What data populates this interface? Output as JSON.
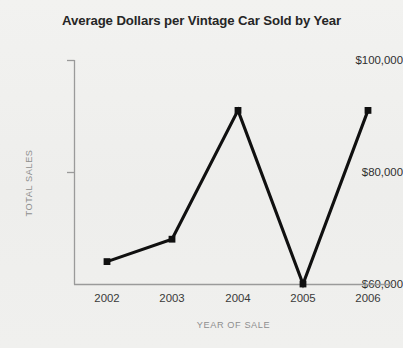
{
  "chart_data": {
    "type": "line",
    "title": "Average Dollars per Vintage Car Sold by Year",
    "xlabel": "YEAR OF SALE",
    "ylabel": "TOTAL SALES",
    "categories": [
      "2002",
      "2003",
      "2004",
      "2005",
      "2006"
    ],
    "values": [
      64000,
      68000,
      91000,
      60000,
      91000
    ],
    "series": [
      {
        "name": "Average Dollars per Vintage Car Sold",
        "values": [
          64000,
          68000,
          91000,
          60000,
          91000
        ]
      }
    ],
    "ylim": [
      60000,
      100000
    ],
    "yticks": [
      60000,
      80000,
      100000
    ],
    "ytick_labels": [
      "$60,000",
      "$80,000",
      "$100,000"
    ],
    "xtick_labels": [
      "2002",
      "2003",
      "2004",
      "2005",
      "2006"
    ],
    "grid": false,
    "legend": false,
    "legend_position": "none",
    "marker": "square",
    "line_color": "#101010",
    "background_color": "#f1f1ef",
    "axis_color": "#9a9a9a",
    "title_color": "#262626",
    "axis_label_color": "#8e8e8e",
    "tick_label_color": "#2f2f2f"
  }
}
